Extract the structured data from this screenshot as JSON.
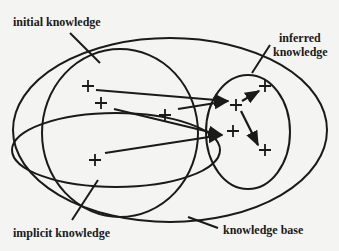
{
  "diagram": {
    "labels": {
      "initial_knowledge": "initial knowledge",
      "inferred_knowledge_line1": "inferred",
      "inferred_knowledge_line2": "knowledge",
      "implicit_knowledge": "implicit knowledge",
      "knowledge_base": "knowledge base"
    },
    "regions": [
      {
        "name": "knowledge base",
        "shape": "outer ellipse"
      },
      {
        "name": "initial knowledge",
        "shape": "large left ellipse"
      },
      {
        "name": "implicit knowledge",
        "shape": "flat ellipse inside initial knowledge"
      },
      {
        "name": "inferred knowledge",
        "shape": "right ellipse"
      }
    ],
    "colors": {
      "ink": "#1a1a1a",
      "paper": "#f4f4f2"
    }
  }
}
